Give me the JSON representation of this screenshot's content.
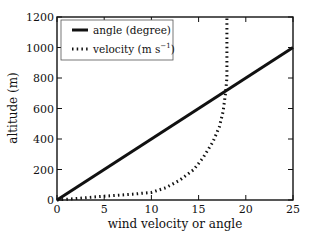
{
  "chart_data": {
    "type": "line",
    "title": "",
    "xlabel": "wind velocity or angle",
    "ylabel": "altitude (m)",
    "xlim": [
      0,
      25
    ],
    "ylim": [
      0,
      1200
    ],
    "xticks": [
      0,
      5,
      10,
      15,
      20,
      25
    ],
    "yticks": [
      0,
      200,
      400,
      600,
      800,
      1000,
      1200
    ],
    "grid": false,
    "legend_position": "upper left",
    "series": [
      {
        "name": "angle (degree)",
        "style": "solid",
        "points": [
          [
            0,
            0
          ],
          [
            25,
            1000
          ]
        ]
      },
      {
        "name": "velocity (m s⁻¹)",
        "style": "dotted",
        "points": [
          [
            0,
            0
          ],
          [
            2,
            10
          ],
          [
            5,
            25
          ],
          [
            8,
            38
          ],
          [
            10,
            50
          ],
          [
            11.5,
            80
          ],
          [
            13,
            130
          ],
          [
            14.5,
            200
          ],
          [
            15.5,
            280
          ],
          [
            16.5,
            380
          ],
          [
            17.2,
            480
          ],
          [
            17.6,
            580
          ],
          [
            17.85,
            700
          ],
          [
            18,
            800
          ],
          [
            18,
            1000
          ],
          [
            18,
            1200
          ]
        ]
      }
    ]
  },
  "legend": {
    "items": [
      {
        "label": "angle (degree)"
      },
      {
        "label": "velocity (m s",
        "superscript": "−1",
        "suffix": ")"
      }
    ]
  }
}
